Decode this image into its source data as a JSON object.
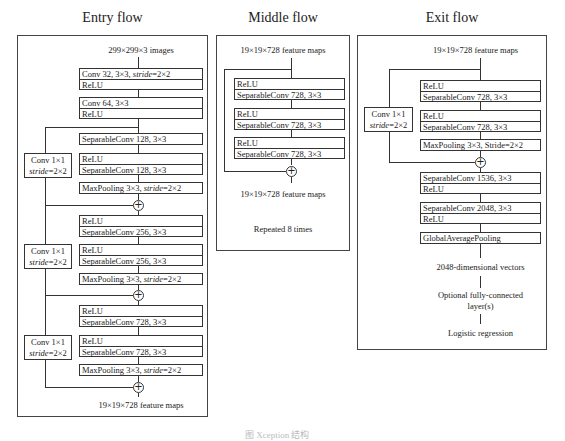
{
  "entry": {
    "title": "Entry flow",
    "input": "299×299×3 images",
    "conv1": [
      "Conv 32, 3×3, stride=2×2",
      "ReLU"
    ],
    "conv2": [
      "Conv 64, 3×3",
      "ReLU"
    ],
    "block1": {
      "sep1": "SeparableConv 128, 3×3",
      "relu2": "ReLU",
      "sep2": "SeparableConv 128, 3×3",
      "pool": "MaxPooling 3×3, stride=2×2",
      "skip": [
        "Conv 1×1",
        "stride=2×2"
      ]
    },
    "block2": {
      "relu1": "ReLU",
      "sep1": "SeparableConv 256, 3×3",
      "relu2": "ReLU",
      "sep2": "SeparableConv 256, 3×3",
      "pool": "MaxPooling 3×3, stride=2×2",
      "skip": [
        "Conv 1×1",
        "stride=2×2"
      ]
    },
    "block3": {
      "relu1": "ReLU",
      "sep1": "SeparableConv 728, 3×3",
      "relu2": "ReLU",
      "sep2": "SeparableConv 728, 3×3",
      "pool": "MaxPooling 3×3, stride=2×2",
      "skip": [
        "Conv 1×1",
        "stride=2×2"
      ]
    },
    "output": "19×19×728 feature maps"
  },
  "middle": {
    "title": "Middle flow",
    "input": "19×19×728 feature maps",
    "layers": [
      [
        "ReLU",
        "SeparableConv 728, 3×3"
      ],
      [
        "ReLU",
        "SeparableConv 728, 3×3"
      ],
      [
        "ReLU",
        "SeparableConv 728, 3×3"
      ]
    ],
    "output": "19×19×728 feature maps",
    "repeat": "Repeated 8 times"
  },
  "exit": {
    "title": "Exit flow",
    "input": "19×19×728 feature maps",
    "layers": [
      [
        "ReLU",
        "SeparableConv 728, 3×3"
      ],
      [
        "ReLU",
        "SeparableConv 728, 3×3"
      ]
    ],
    "pool": "MaxPooling 3×3, Stride=2×2",
    "skip": [
      "Conv 1×1",
      "stride=2×2"
    ],
    "post": [
      [
        "SeparableConv 1536, 3×3",
        "ReLU"
      ],
      [
        "SeparableConv 2048, 3×3",
        "ReLU"
      ]
    ],
    "gap": "GlobalAveragePooling",
    "vec": "2048-dimensional vectors",
    "fc": [
      "Optional fully-connected",
      "layer(s)"
    ],
    "logit": "Logistic regression"
  },
  "caption": "图 Xception 结构"
}
